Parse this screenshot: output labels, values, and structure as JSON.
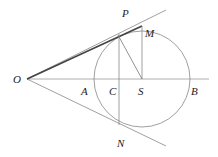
{
  "diagram": {
    "type": "geometry",
    "colors": {
      "line": "#777777",
      "thick": "#444444",
      "circle": "#888888",
      "label": "#222222"
    },
    "points": {
      "O": {
        "label": "O",
        "x": 27,
        "y": 79
      },
      "P": {
        "label": "P",
        "x": 118,
        "y": 33
      },
      "M": {
        "label": "M",
        "x": 142,
        "y": 26
      },
      "A": {
        "label": "A",
        "x": 94,
        "y": 79
      },
      "C": {
        "label": "C",
        "x": 119,
        "y": 79
      },
      "S": {
        "label": "S",
        "x": 142,
        "y": 79
      },
      "B": {
        "label": "B",
        "x": 190,
        "y": 79
      },
      "N": {
        "label": "N",
        "x": 119,
        "y": 125
      }
    },
    "circle": {
      "center": "S",
      "cx": 142,
      "cy": 79,
      "r": 48
    },
    "labels": [
      {
        "text": "P",
        "x": 122,
        "y": 17
      },
      {
        "text": "M",
        "x": 145,
        "y": 36
      },
      {
        "text": "O",
        "x": 13,
        "y": 83
      },
      {
        "text": "A",
        "x": 81,
        "y": 94
      },
      {
        "text": "C",
        "x": 109,
        "y": 94
      },
      {
        "text": "S",
        "x": 138,
        "y": 94
      },
      {
        "text": "B",
        "x": 191,
        "y": 94
      },
      {
        "text": "N",
        "x": 117,
        "y": 147
      }
    ]
  }
}
